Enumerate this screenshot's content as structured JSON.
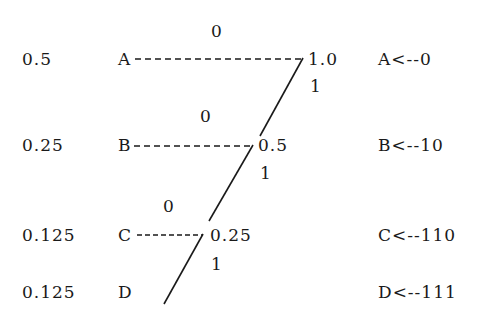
{
  "diagram": {
    "type": "huffman-coding-tree",
    "rows": [
      {
        "symbol": "A",
        "probability": "0.5",
        "node_value": "1.0",
        "branch_zero": "0",
        "branch_one": "1",
        "code_label": "A<--0"
      },
      {
        "symbol": "B",
        "probability": "0.25",
        "node_value": "0.5",
        "branch_zero": "0",
        "branch_one": "1",
        "code_label": "B<--10"
      },
      {
        "symbol": "C",
        "probability": "0.125",
        "node_value": "0.25",
        "branch_zero": "0",
        "branch_one": "1",
        "code_label": "C<--110"
      },
      {
        "symbol": "D",
        "probability": "0.125",
        "code_label": "D<--111"
      }
    ],
    "colors": {
      "ink": "#1a1a1a",
      "background": "#ffffff"
    }
  }
}
